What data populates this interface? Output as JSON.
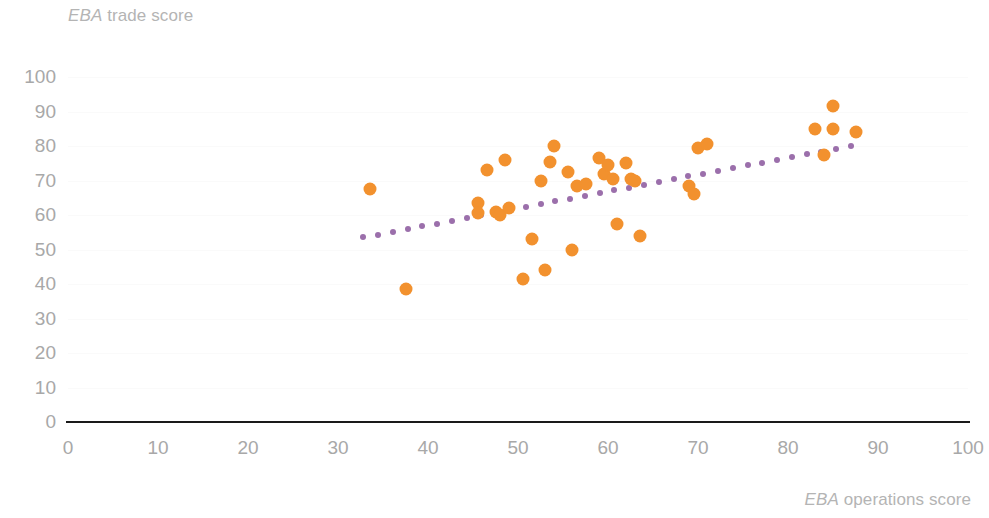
{
  "chart_data": {
    "type": "scatter",
    "title": "",
    "xlabel": "EBA operations score",
    "xlabel_emphasis": "EBA",
    "xlabel_rest": " operations score",
    "ylabel": "EBA trade score",
    "ylabel_emphasis": "EBA",
    "ylabel_rest": " trade score",
    "xlim": [
      0,
      100
    ],
    "ylim": [
      0,
      100
    ],
    "x_ticks": [
      0,
      10,
      20,
      30,
      40,
      50,
      60,
      70,
      80,
      90,
      100
    ],
    "y_ticks": [
      0,
      10,
      20,
      30,
      40,
      50,
      60,
      70,
      80,
      90,
      100
    ],
    "grid": "faint-horizontal",
    "legend": "none",
    "point_color": "#f2912e",
    "trendline_color": "#9b6fab",
    "axis_color": "#1a1a1a",
    "tick_label_color": "#a8a8a8",
    "points": [
      {
        "x": 33.5,
        "y": 67.5
      },
      {
        "x": 37.5,
        "y": 38.5
      },
      {
        "x": 45.5,
        "y": 63.5
      },
      {
        "x": 45.5,
        "y": 60.5
      },
      {
        "x": 46.5,
        "y": 73.0
      },
      {
        "x": 47.5,
        "y": 61.0
      },
      {
        "x": 48.0,
        "y": 60.0
      },
      {
        "x": 48.5,
        "y": 76.0
      },
      {
        "x": 49.0,
        "y": 62.0
      },
      {
        "x": 50.5,
        "y": 41.5
      },
      {
        "x": 51.5,
        "y": 53.0
      },
      {
        "x": 52.5,
        "y": 70.0
      },
      {
        "x": 53.0,
        "y": 44.0
      },
      {
        "x": 53.5,
        "y": 75.5
      },
      {
        "x": 54.0,
        "y": 80.0
      },
      {
        "x": 55.5,
        "y": 72.5
      },
      {
        "x": 56.0,
        "y": 50.0
      },
      {
        "x": 56.5,
        "y": 68.5
      },
      {
        "x": 57.5,
        "y": 69.0
      },
      {
        "x": 59.0,
        "y": 76.5
      },
      {
        "x": 59.5,
        "y": 72.0
      },
      {
        "x": 60.0,
        "y": 74.5
      },
      {
        "x": 60.5,
        "y": 70.5
      },
      {
        "x": 61.0,
        "y": 57.5
      },
      {
        "x": 62.0,
        "y": 75.0
      },
      {
        "x": 62.5,
        "y": 70.5
      },
      {
        "x": 63.0,
        "y": 70.0
      },
      {
        "x": 63.5,
        "y": 54.0
      },
      {
        "x": 69.0,
        "y": 68.5
      },
      {
        "x": 69.5,
        "y": 66.0
      },
      {
        "x": 70.0,
        "y": 79.5
      },
      {
        "x": 71.0,
        "y": 80.5
      },
      {
        "x": 83.0,
        "y": 85.0
      },
      {
        "x": 84.0,
        "y": 77.5
      },
      {
        "x": 85.0,
        "y": 91.5
      },
      {
        "x": 85.0,
        "y": 85.0
      },
      {
        "x": 87.5,
        "y": 84.0
      }
    ],
    "trendline": {
      "x_start": 32.8,
      "y_start": 53.5,
      "x_end": 87.0,
      "y_end": 80.0,
      "style": "dotted",
      "dot_count": 34
    }
  }
}
